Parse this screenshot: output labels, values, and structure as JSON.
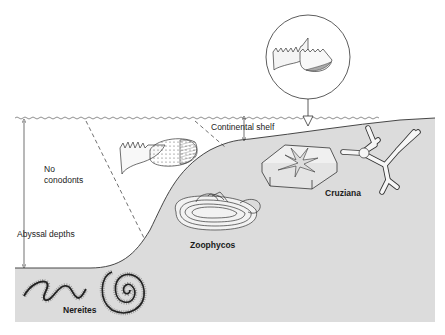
{
  "diagram": {
    "type": "cross-section",
    "colors": {
      "sediment": "#dcdcdc",
      "water": "#ffffff",
      "line": "#333333"
    },
    "labels": {
      "no_conodonts_1": "No",
      "no_conodonts_2": "conodonts",
      "abyssal_depths": "Abyssal depths",
      "continental_shelf": "Continental shelf",
      "zoophycos": "Zoophycos",
      "cruziana": "Cruziana",
      "nereites": "Nereites"
    },
    "elements": [
      {
        "name": "sea-surface",
        "kind": "wavy line"
      },
      {
        "name": "seafloor-profile",
        "kind": "slope from shelf to abyss"
      },
      {
        "name": "abyssal-depth-arrow",
        "kind": "double-headed vertical arrow"
      },
      {
        "name": "shelf-depth-arrow",
        "kind": "double-headed vertical arrow"
      },
      {
        "name": "conodont-boundary-dashes",
        "kind": "two dashed lines"
      },
      {
        "name": "conodont-inset-circle",
        "kind": "magnified conodont with down arrow"
      },
      {
        "name": "conodont-fossil-slope",
        "kind": "conodont drawing"
      },
      {
        "name": "star-trace-fossil",
        "kind": "hexagonal block with star"
      },
      {
        "name": "cruziana-fossil",
        "kind": "branching burrow"
      },
      {
        "name": "zoophycos-fossil",
        "kind": "spreite trace"
      },
      {
        "name": "nereites-fossil",
        "kind": "meandering and spiral trails"
      }
    ]
  }
}
